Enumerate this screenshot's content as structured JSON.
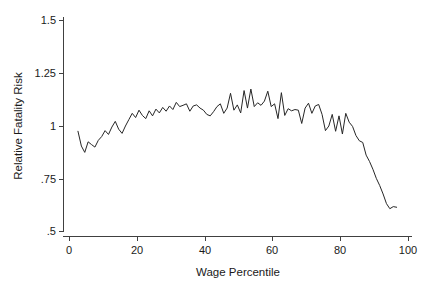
{
  "chart_data": {
    "type": "line",
    "title": "",
    "subtitle": "",
    "xlabel": "Wage Percentile",
    "ylabel": "Relative Fatality Risk",
    "xlim": [
      0,
      100
    ],
    "ylim": [
      0.5,
      1.5
    ],
    "grid": false,
    "legend": "none",
    "xticks": [
      0,
      20,
      40,
      60,
      80,
      100
    ],
    "xtick_labels": [
      "0",
      "20",
      "40",
      "60",
      "80",
      "100"
    ],
    "yticks": [
      0.5,
      0.75,
      1,
      1.25,
      1.5
    ],
    "ytick_labels": [
      ".5",
      ".75",
      "1",
      "1.25",
      "1.5"
    ],
    "series": [
      {
        "name": "Relative Fatality Risk",
        "color": "#262626",
        "x": [
          2.5,
          3.5,
          4.5,
          5.5,
          6.5,
          7.5,
          8.5,
          9.5,
          10.5,
          11.5,
          12.5,
          13.5,
          14.5,
          15.5,
          16.5,
          17.5,
          18.5,
          19.5,
          20.5,
          21.5,
          22.5,
          23.5,
          24.5,
          25.5,
          26.5,
          27.5,
          28.5,
          29.5,
          30.5,
          31.5,
          32.5,
          33.5,
          34.5,
          35.5,
          36.5,
          37.5,
          38.5,
          39.5,
          40.5,
          41.5,
          42.5,
          43.5,
          44.5,
          45.5,
          46.5,
          47.5,
          48.5,
          49.5,
          50.5,
          51.5,
          52.5,
          53.5,
          54.5,
          55.5,
          56.5,
          57.5,
          58.5,
          59.5,
          60.5,
          61.5,
          62.5,
          63.5,
          64.5,
          65.5,
          66.5,
          67.5,
          68.5,
          69.5,
          70.5,
          71.5,
          72.5,
          73.5,
          74.5,
          75.5,
          76.5,
          77.5,
          78.5,
          79.5,
          80.5,
          81.5,
          82.5,
          83.5,
          84.5,
          85.5,
          86.5,
          87.5,
          88.5,
          89.5,
          90.5,
          91.5,
          92.5,
          93.5,
          94.5,
          95.5,
          96.5
        ],
        "y": [
          0.975,
          0.905,
          0.875,
          0.925,
          0.912,
          0.9,
          0.932,
          0.95,
          0.978,
          0.96,
          0.995,
          1.022,
          0.985,
          0.965,
          1.0,
          1.03,
          1.06,
          1.04,
          1.075,
          1.05,
          1.035,
          1.072,
          1.048,
          1.08,
          1.062,
          1.088,
          1.07,
          1.095,
          1.078,
          1.112,
          1.092,
          1.098,
          1.105,
          1.07,
          1.095,
          1.1,
          1.085,
          1.075,
          1.055,
          1.048,
          1.068,
          1.092,
          1.105,
          1.06,
          1.085,
          1.155,
          1.075,
          1.1,
          1.062,
          1.168,
          1.085,
          1.175,
          1.092,
          1.11,
          1.098,
          1.118,
          1.165,
          1.092,
          1.105,
          1.035,
          1.158,
          1.05,
          1.082,
          1.072,
          1.078,
          1.075,
          1.012,
          1.085,
          1.108,
          1.06,
          1.095,
          1.102,
          1.055,
          0.978,
          1.0,
          1.055,
          0.975,
          1.048,
          0.962,
          1.06,
          1.018,
          0.998,
          0.955,
          0.93,
          0.922,
          0.862,
          0.832,
          0.795,
          0.752,
          0.718,
          0.678,
          0.632,
          0.608,
          0.618,
          0.615
        ]
      }
    ]
  }
}
